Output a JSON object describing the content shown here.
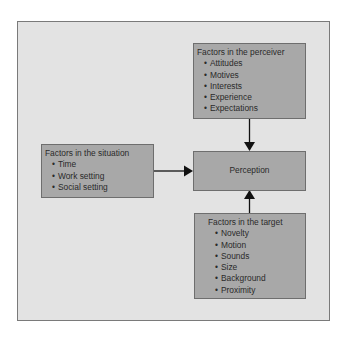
{
  "diagram": {
    "perceiver": {
      "title": "Factors in the perceiver",
      "items": [
        "Attitudes",
        "Motives",
        "Interests",
        "Experience",
        "Expectations"
      ]
    },
    "situation": {
      "title": "Factors in the situation",
      "items": [
        "Time",
        "Work setting",
        "Social setting"
      ]
    },
    "perception": {
      "label": "Perception"
    },
    "target": {
      "title": "Factors in the target",
      "items": [
        "Novelty",
        "Motion",
        "Sounds",
        "Size",
        "Background",
        "Proximity"
      ]
    },
    "edges": [
      {
        "from": "perceiver",
        "to": "perception"
      },
      {
        "from": "situation",
        "to": "perception"
      },
      {
        "from": "target",
        "to": "perception"
      }
    ],
    "colors": {
      "frame": "#e3e3e3",
      "box": "#a8a8a8",
      "border": "#6e6e6e",
      "arrow": "#111111"
    }
  }
}
